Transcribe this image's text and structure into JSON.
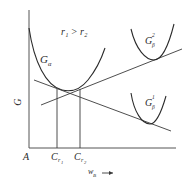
{
  "diagram": {
    "condition_label": "r₁ > r₂",
    "axes": {
      "y_label": "G",
      "origin_label": "A",
      "x_label": "w",
      "x_label_sub": "B",
      "x_arrow": "→"
    },
    "curves": [
      {
        "id": "G_alpha",
        "label": "G",
        "sub": "α"
      },
      {
        "id": "G_beta_2",
        "label": "G",
        "sub": "β",
        "sup": "2"
      },
      {
        "id": "G_beta_1",
        "label": "G",
        "sub": "β",
        "sup": "1"
      }
    ],
    "compositions": [
      {
        "label": "C",
        "sub": "r",
        "subsub": "1"
      },
      {
        "label": "C",
        "sub": "r",
        "subsub": "2"
      }
    ],
    "colors": {
      "ink": "#2b2b2b",
      "background": "#ffffff"
    }
  }
}
